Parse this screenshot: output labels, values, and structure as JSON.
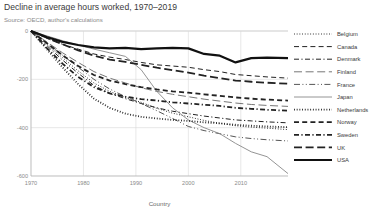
{
  "header": {
    "title": "Decline in average hours worked, 1970–2019",
    "subtitle": "Source: OECD, author's calculations"
  },
  "chart_data": {
    "type": "line",
    "title": "Decline in average hours worked, 1970–2019",
    "subtitle": "Source: OECD, author's calculations",
    "xlabel": "Country",
    "ylabel": "",
    "xlim": [
      1970,
      2019
    ],
    "ylim": [
      -600,
      0
    ],
    "xticks": [
      1970,
      1980,
      1990,
      2000,
      2010
    ],
    "yticks": [
      0,
      -200,
      -400,
      -600
    ],
    "xtick_labels": [
      "1970",
      "1980",
      "1990",
      "2000",
      "2010"
    ],
    "ytick_labels": [
      "0",
      "-200",
      "-400",
      "-600"
    ],
    "grid": true,
    "legend_position": "right",
    "x": [
      1970,
      1973,
      1976,
      1979,
      1982,
      1985,
      1988,
      1991,
      1994,
      1997,
      2000,
      2003,
      2006,
      2009,
      2012,
      2015,
      2019
    ],
    "series": [
      {
        "name": "Belgium",
        "style": "dotted",
        "width": 1.0,
        "color": "#222222",
        "values": [
          0,
          -55,
          -110,
          -165,
          -215,
          -250,
          -275,
          -295,
          -320,
          -340,
          -355,
          -370,
          -382,
          -392,
          -398,
          -402,
          -408
        ]
      },
      {
        "name": "Canada",
        "style": "dashed",
        "width": 1.0,
        "color": "#222222",
        "values": [
          0,
          -30,
          -55,
          -75,
          -95,
          -108,
          -118,
          -130,
          -140,
          -145,
          -150,
          -160,
          -168,
          -180,
          -185,
          -190,
          -195
        ]
      },
      {
        "name": "Denmark",
        "style": "dashdot",
        "width": 1.0,
        "color": "#222222",
        "values": [
          0,
          -60,
          -120,
          -175,
          -225,
          -258,
          -280,
          -300,
          -318,
          -332,
          -342,
          -352,
          -360,
          -368,
          -372,
          -376,
          -380
        ]
      },
      {
        "name": "Finland",
        "style": "longdash",
        "width": 1.0,
        "color": "#777777",
        "values": [
          0,
          -45,
          -90,
          -130,
          -168,
          -195,
          -215,
          -235,
          -250,
          -262,
          -272,
          -282,
          -290,
          -298,
          -304,
          -308,
          -312
        ]
      },
      {
        "name": "France",
        "style": "dashdotdot",
        "width": 1.0,
        "color": "#555555",
        "values": [
          0,
          -50,
          -100,
          -150,
          -200,
          -240,
          -272,
          -300,
          -330,
          -362,
          -395,
          -412,
          -425,
          -438,
          -445,
          -450,
          -455
        ]
      },
      {
        "name": "Japan",
        "style": "solid",
        "width": 0.9,
        "color": "#888888",
        "values": [
          0,
          -20,
          -40,
          -58,
          -75,
          -90,
          -105,
          -160,
          -250,
          -318,
          -368,
          -400,
          -425,
          -465,
          -500,
          -520,
          -590
        ]
      },
      {
        "name": "Netherlands",
        "style": "dotted",
        "width": 1.8,
        "color": "#222222",
        "values": [
          0,
          -75,
          -150,
          -220,
          -280,
          -318,
          -342,
          -355,
          -362,
          -368,
          -372,
          -378,
          -382,
          -388,
          -392,
          -395,
          -398
        ]
      },
      {
        "name": "Norway",
        "style": "dashed",
        "width": 1.8,
        "color": "#222222",
        "values": [
          0,
          -50,
          -100,
          -145,
          -182,
          -205,
          -220,
          -232,
          -242,
          -250,
          -255,
          -262,
          -268,
          -275,
          -280,
          -284,
          -288
        ]
      },
      {
        "name": "Sweden",
        "style": "dashdot",
        "width": 1.8,
        "color": "#222222",
        "values": [
          0,
          -70,
          -135,
          -190,
          -232,
          -258,
          -272,
          -282,
          -288,
          -295,
          -300,
          -305,
          -310,
          -318,
          -322,
          -326,
          -330
        ]
      },
      {
        "name": "UK",
        "style": "longdash",
        "width": 1.8,
        "color": "#222222",
        "values": [
          0,
          -28,
          -55,
          -80,
          -102,
          -118,
          -128,
          -140,
          -152,
          -162,
          -172,
          -185,
          -195,
          -205,
          -210,
          -214,
          -218
        ]
      },
      {
        "name": "USA",
        "style": "solid",
        "width": 2.2,
        "color": "#111111",
        "values": [
          0,
          -25,
          -45,
          -58,
          -68,
          -72,
          -70,
          -75,
          -72,
          -70,
          -72,
          -95,
          -102,
          -130,
          -112,
          -110,
          -112
        ]
      }
    ]
  },
  "legend": {
    "items": [
      {
        "label": "Belgium"
      },
      {
        "label": "Canada"
      },
      {
        "label": "Denmark"
      },
      {
        "label": "Finland"
      },
      {
        "label": "France"
      },
      {
        "label": "Japan"
      },
      {
        "label": "Netherlands"
      },
      {
        "label": "Norway"
      },
      {
        "label": "Sweden"
      },
      {
        "label": "UK"
      },
      {
        "label": "USA"
      }
    ]
  }
}
